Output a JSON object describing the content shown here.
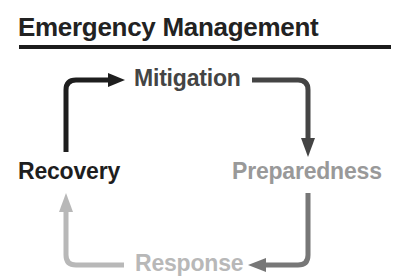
{
  "title": "Emergency Management",
  "nodes": {
    "mitigation": {
      "label": "Mitigation",
      "color": "#444444"
    },
    "preparedness": {
      "label": "Preparedness",
      "color": "#999999"
    },
    "response": {
      "label": "Response",
      "color": "#b8b8b8"
    },
    "recovery": {
      "label": "Recovery",
      "color": "#1e1e1e"
    }
  },
  "arrows": [
    {
      "from": "recovery",
      "to": "mitigation",
      "color": "#1e1e1e"
    },
    {
      "from": "mitigation",
      "to": "preparedness",
      "color": "#444444"
    },
    {
      "from": "preparedness",
      "to": "response",
      "color": "#777777"
    },
    {
      "from": "response",
      "to": "recovery",
      "color": "#b8b8b8"
    }
  ]
}
